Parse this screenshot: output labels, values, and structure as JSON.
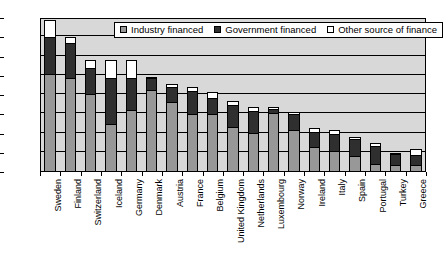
{
  "chart_data": {
    "type": "bar",
    "stacked": true,
    "title": "",
    "subtitle": "",
    "xlabel": "",
    "ylabel": "",
    "ylim": [
      0.0,
      4.0
    ],
    "ytick_step": 0.5,
    "ytick_labels": [
      "0.0",
      "0.5",
      "1.0",
      "1.5",
      "2.0",
      "2.5",
      "3.0",
      "3.5",
      "4.0"
    ],
    "grid": true,
    "legend_position": "top-center",
    "categories": [
      "Sweden",
      "Finland",
      "Switzerland",
      "Iceland",
      "Germany",
      "Denmark",
      "Austria",
      "France",
      "Belgium",
      "United Kingdom",
      "Netherlands",
      "Luxembourg",
      "Norway",
      "Ireland",
      "Italy",
      "Spain",
      "Portugal",
      "Turkey",
      "Greece"
    ],
    "series": [
      {
        "name": "Industry financed",
        "color": "#989898",
        "values": [
          2.55,
          2.45,
          2.02,
          1.25,
          1.62,
          2.12,
          1.82,
          1.5,
          1.5,
          1.18,
          1.02,
          1.53,
          1.1,
          0.64,
          0.55,
          0.42,
          0.21,
          0.18,
          0.17
        ]
      },
      {
        "name": "Government financed",
        "color": "#2f2f2f",
        "values": [
          0.95,
          0.9,
          0.68,
          1.2,
          0.82,
          0.32,
          0.4,
          0.6,
          0.43,
          0.57,
          0.56,
          0.12,
          0.4,
          0.4,
          0.45,
          0.45,
          0.47,
          0.28,
          0.27
        ]
      },
      {
        "name": "Other source of finance",
        "color": "#ffffff",
        "values": [
          0.45,
          0.15,
          0.2,
          0.45,
          0.46,
          0.04,
          0.06,
          0.12,
          0.14,
          0.1,
          0.12,
          0.05,
          0.06,
          0.11,
          0.08,
          0.04,
          0.07,
          0.04,
          0.15
        ]
      }
    ],
    "totals": [
      3.95,
      3.5,
      2.9,
      2.9,
      2.9,
      2.48,
      2.28,
      2.22,
      2.07,
      1.85,
      1.7,
      1.7,
      1.56,
      1.15,
      1.08,
      0.91,
      0.75,
      0.5,
      0.59
    ]
  },
  "legend": {
    "items": [
      {
        "label": "Industry financed",
        "swatch": "industry-swatch"
      },
      {
        "label": "Government financed",
        "swatch": "government-swatch"
      },
      {
        "label": "Other source of finance",
        "swatch": "other-swatch"
      }
    ]
  }
}
